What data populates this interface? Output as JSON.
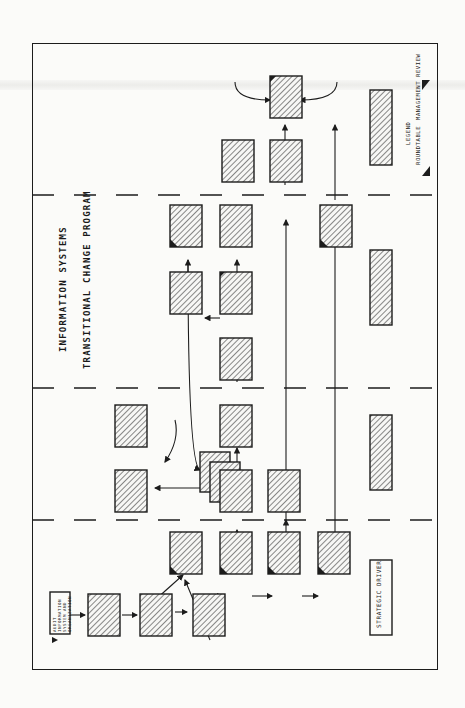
{
  "diagram": {
    "title_line1": "INFORMATION SYSTEMS",
    "title_line2": "TRANSITIONAL CHANGE PROGRAM",
    "orientation": "rotated 90 degrees counterclockwise",
    "phases": [
      "Phase 1",
      "Phase 2",
      "Phase 3",
      "Phase 4"
    ],
    "start_box": "AUDIT INFORMATION SYSTEM AND ORGANIZATION",
    "row_labels": [
      "STRATEGIC DRIVER",
      "",
      "",
      ""
    ],
    "legend": {
      "title": "LEGEND",
      "items": [
        "ROUNDTABLE",
        "MANAGEMENT REVIEW"
      ]
    },
    "colors": {
      "ink": "#1c1c1c",
      "paper": "#fbfbf9"
    }
  }
}
